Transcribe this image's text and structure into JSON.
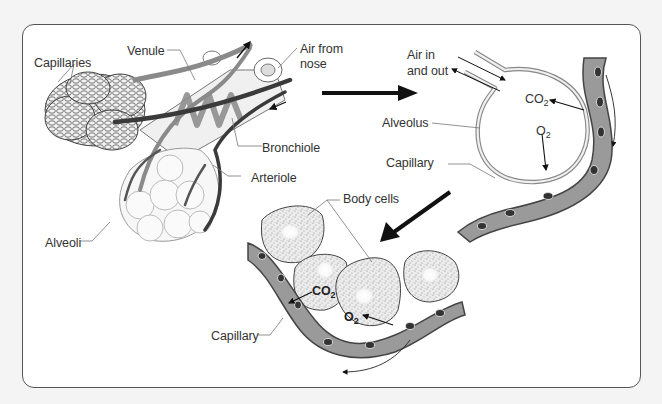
{
  "diagram": {
    "frame_color": "#555555",
    "background": "#f4f4f4",
    "capillary_fill": "#9a9a9a",
    "cell_fill": "#e6e6e6",
    "arrow_color": "#111111",
    "lung_section": {
      "labels": {
        "capillaries": "Capillaries",
        "venule": "Venule",
        "air_from_nose": "Air from\nnose",
        "air_from_nose_l1": "Air from",
        "air_from_nose_l2": "nose",
        "bronchiole": "Bronchiole",
        "arteriole": "Arteriole",
        "alveoli": "Alveoli"
      }
    },
    "alveolus_section": {
      "labels": {
        "air_in_out_l1": "Air in",
        "air_in_out_l2": "and out",
        "alveolus": "Alveolus",
        "capillary": "Capillary",
        "co2_base": "CO",
        "co2_sub": "2",
        "o2_base": "O",
        "o2_sub": "2"
      }
    },
    "tissue_section": {
      "labels": {
        "body_cells": "Body cells",
        "capillary": "Capillary",
        "co2_base": "CO",
        "co2_sub": "2",
        "o2_base": "O",
        "o2_sub": "2"
      }
    },
    "flow_arrows": [
      {
        "name": "lungs-to-alveolus",
        "direction": "right"
      },
      {
        "name": "alveolus-to-tissue",
        "direction": "down-left"
      }
    ]
  }
}
